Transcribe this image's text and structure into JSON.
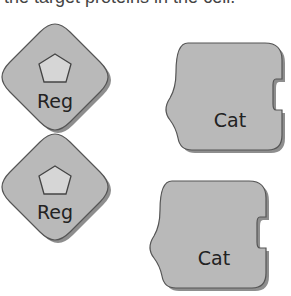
{
  "caption": "the target proteins in the cell.",
  "regulatory_units": [
    {
      "label": "Reg",
      "center_x": 55,
      "center_y": 77
    },
    {
      "label": "Reg",
      "center_x": 55,
      "center_y": 188
    }
  ],
  "catalytic_units": [
    {
      "label": "Cat",
      "x": 165,
      "y": 45
    },
    {
      "label": "Cat",
      "x": 150,
      "y": 182
    }
  ],
  "colors": {
    "shape_fill": "#b9b9b9",
    "shape_stroke": "#555555",
    "shadow": "#8e8e8e",
    "pentagon_fill": "#d6d6d6",
    "text": "#222222"
  }
}
